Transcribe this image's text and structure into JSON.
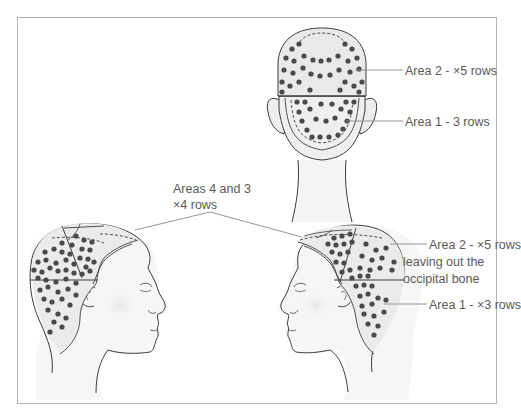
{
  "figure": {
    "title": "",
    "colors": {
      "dot": "#4a4a4a",
      "scalp_fill": "#ebebeb",
      "skin_fill": "#f5f5f5",
      "outline": "#3c3c3c",
      "leader_line": "#8a8a8a",
      "text": "#5a5a5a",
      "frame": "#b5b5b5"
    },
    "views": [
      {
        "id": "back",
        "name": "Back view of head"
      },
      {
        "id": "left-profile",
        "name": "Right-facing side view"
      },
      {
        "id": "right-profile",
        "name": "Left-facing side view"
      }
    ],
    "labels": {
      "back_area2": "Area 2 - ×5 rows",
      "back_area1": "Area 1 - 3 rows",
      "areas43_line1": "Areas 4 and 3",
      "areas43_line2": "×4 rows",
      "side_area2_line1": "Area 2 - ×5 rows",
      "side_area2_line2": "leaving out the",
      "side_area2_line3": "occipital bone",
      "side_area1": "Area 1 - ×3 rows"
    }
  }
}
